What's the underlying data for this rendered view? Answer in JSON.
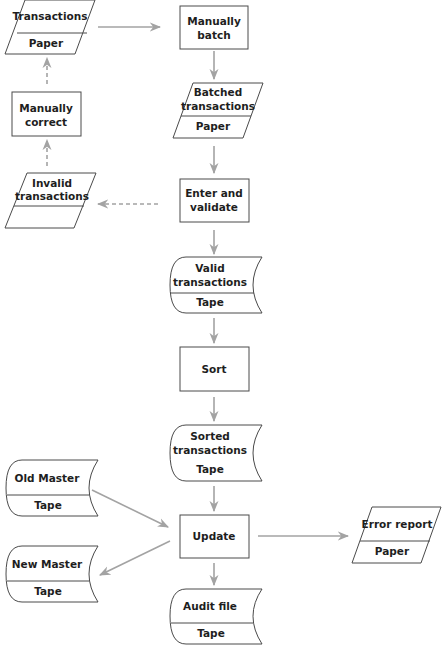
{
  "diagram": {
    "type": "system flowchart",
    "colors": {
      "stroke": "#4a4a4a",
      "arrow": "#a3a3a3",
      "text": "#1e1e1e",
      "background": "#ffffff"
    },
    "nodes": {
      "transactions": {
        "shape": "document-parallelogram",
        "line1": "Transactions",
        "media": "Paper"
      },
      "manually_batch": {
        "shape": "process",
        "line1": "Manually",
        "line2": "batch"
      },
      "batched": {
        "shape": "document-parallelogram",
        "line1": "Batched",
        "line2": "transactions",
        "media": "Paper"
      },
      "enter_validate": {
        "shape": "process",
        "line1": "Enter and",
        "line2": "validate"
      },
      "invalid": {
        "shape": "document-parallelogram",
        "line1": "Invalid",
        "line2": "transactions",
        "media": ""
      },
      "manually_correct": {
        "shape": "process",
        "line1": "Manually",
        "line2": "correct"
      },
      "valid": {
        "shape": "tape",
        "line1": "Valid",
        "line2": "transactions",
        "media": "Tape"
      },
      "sort": {
        "shape": "process",
        "line1": "Sort"
      },
      "sorted": {
        "shape": "tape",
        "line1": "Sorted",
        "line2": "transactions",
        "media": "Tape"
      },
      "old_master": {
        "shape": "tape",
        "line1": "Old Master",
        "media": "Tape"
      },
      "update": {
        "shape": "process",
        "line1": "Update"
      },
      "new_master": {
        "shape": "tape",
        "line1": "New Master",
        "media": "Tape"
      },
      "error_report": {
        "shape": "document-parallelogram",
        "line1": "Error report",
        "media": "Paper"
      },
      "audit_file": {
        "shape": "tape",
        "line1": "Audit file",
        "media": "Tape"
      }
    },
    "edges": [
      {
        "from": "transactions",
        "to": "manually_batch",
        "style": "solid"
      },
      {
        "from": "manually_batch",
        "to": "batched",
        "style": "solid"
      },
      {
        "from": "batched",
        "to": "enter_validate",
        "style": "solid"
      },
      {
        "from": "enter_validate",
        "to": "invalid",
        "style": "dashed"
      },
      {
        "from": "invalid",
        "to": "manually_correct",
        "style": "dashed"
      },
      {
        "from": "manually_correct",
        "to": "transactions",
        "style": "dashed"
      },
      {
        "from": "enter_validate",
        "to": "valid",
        "style": "solid"
      },
      {
        "from": "valid",
        "to": "sort",
        "style": "solid"
      },
      {
        "from": "sort",
        "to": "sorted",
        "style": "solid"
      },
      {
        "from": "sorted",
        "to": "update",
        "style": "solid"
      },
      {
        "from": "old_master",
        "to": "update",
        "style": "solid"
      },
      {
        "from": "update",
        "to": "new_master",
        "style": "solid"
      },
      {
        "from": "update",
        "to": "error_report",
        "style": "solid"
      },
      {
        "from": "update",
        "to": "audit_file",
        "style": "solid"
      }
    ]
  }
}
